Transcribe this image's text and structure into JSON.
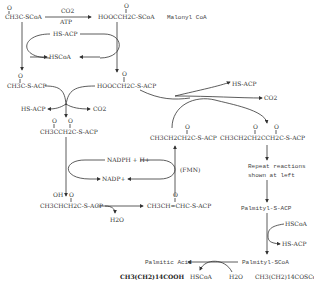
{
  "diagram": {
    "nodes": {
      "acetyl_coa": "CH3C-SCoA",
      "co2_top": "CO2",
      "atp": "ATP",
      "malonyl_coa": "HOOCCH2C-SCoA",
      "malonyl_label": "Malonyl CoA",
      "hs_acp_top": "HS-ACP",
      "hscoa_top": "HSCoA",
      "acetyl_acp": "CH3C-S-ACP",
      "malonyl_acp": "HOOCCH2C-S-ACP",
      "hs_acp_mid": "HS-ACP",
      "co2_mid": "CO2",
      "acetoacetyl_acp": "CH3CCH2C-S-ACP",
      "nadph": "NADPH + H+",
      "nadp": "NADP+",
      "hydroxybutyryl_acp": "CH3CHCH2C-S-ACP",
      "oh_label": "OH",
      "h2o_mid": "H2O",
      "crotonyl_acp": "CH3CH=CHC-S-ACP",
      "fmn": "(FMN)",
      "butyryl_acp": "CH3CH2CH2C-S-ACP",
      "hs_acp_right": "HS-ACP",
      "co2_right": "CO2",
      "ketohexanoyl_acp": "CH3CH2CH2CCH2C-S-ACP",
      "repeat_line1": "Repeat reactions",
      "repeat_line2": "shown at left",
      "palmityl_acp": "Palmityl-S-ACP",
      "hscoa_right": "HSCoA",
      "hs_acp_bottom": "HS-ACP",
      "palmityl_coa": "Palmityl-SCoA",
      "palmitic_acid": "Palmitic Acid",
      "hscoa_bottom": "HSCoA",
      "h2o_bottom": "H2O",
      "palmitic_formula": "CH3(CH2)14COOH",
      "palmityl_coa_formula": "CH3(CH2)14COSCoA"
    }
  }
}
